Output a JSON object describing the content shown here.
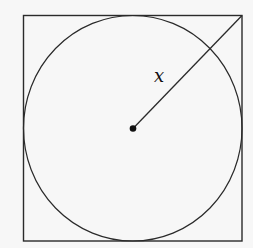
{
  "diagram": {
    "segment_label": "x",
    "colors": {
      "stroke": "#222222",
      "background": "#f7f7f7"
    }
  }
}
